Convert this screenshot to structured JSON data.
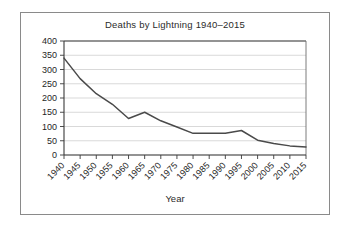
{
  "chart_data": {
    "type": "line",
    "title": "Deaths by Lightning 1940–2015",
    "xlabel": "Year",
    "ylabel": "",
    "categories": [
      1940,
      1945,
      1950,
      1955,
      1960,
      1965,
      1970,
      1975,
      1980,
      1985,
      1990,
      1995,
      2000,
      2005,
      2010,
      2015
    ],
    "xtick_labels": [
      "1940",
      "1945",
      "1950",
      "1955",
      "1960",
      "1965",
      "1970",
      "1975",
      "1980",
      "1985",
      "1990",
      "1995",
      "2000",
      "2005",
      "2010",
      "2015"
    ],
    "values": [
      340,
      268,
      215,
      178,
      128,
      150,
      120,
      98,
      76,
      76,
      76,
      86,
      52,
      40,
      32,
      28
    ],
    "ytick_labels": [
      "0",
      "50",
      "100",
      "150",
      "200",
      "250",
      "300",
      "350",
      "400"
    ],
    "ytick_values": [
      0,
      50,
      100,
      150,
      200,
      250,
      300,
      350,
      400
    ],
    "ylim": [
      0,
      400
    ],
    "xlim": [
      1940,
      2015
    ],
    "grid": "horizontal",
    "legend": "none",
    "line_color": "#4a4a4a",
    "grid_color": "#c9c9c9",
    "axis_color": "#3a3a3a",
    "background_color": "#ffffff",
    "border_color": "#8a8a8a"
  }
}
